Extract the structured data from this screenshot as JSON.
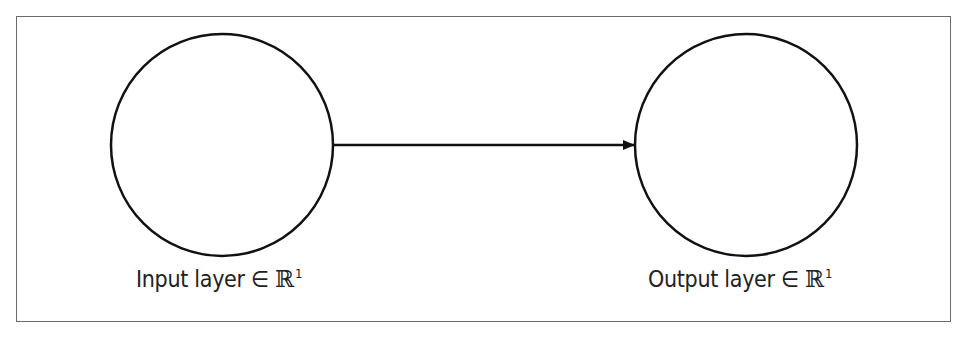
{
  "diagram": {
    "type": "neural-network-layers",
    "nodes": [
      {
        "id": "input",
        "label_text": "Input layer",
        "symbol": "∈",
        "space": "ℝ",
        "exponent": "1",
        "cx": 222,
        "cy": 145,
        "r": 111
      },
      {
        "id": "output",
        "label_text": "Output layer",
        "symbol": "∈",
        "space": "ℝ",
        "exponent": "1",
        "cx": 746,
        "cy": 145,
        "r": 111
      }
    ],
    "edges": [
      {
        "from": "input",
        "to": "output",
        "style": "arrow"
      }
    ],
    "colors": {
      "stroke": "#111111",
      "frame": "#6b6b6b",
      "text": "#222222"
    }
  }
}
